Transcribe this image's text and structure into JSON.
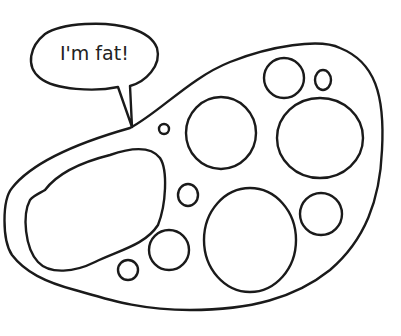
{
  "illustration": {
    "subject": "cell with fat droplets",
    "speech_bubble": {
      "text": "I'm fat!"
    },
    "line_color": "#1a1a1a",
    "background": "#ffffff",
    "vacuole_count": 11
  }
}
